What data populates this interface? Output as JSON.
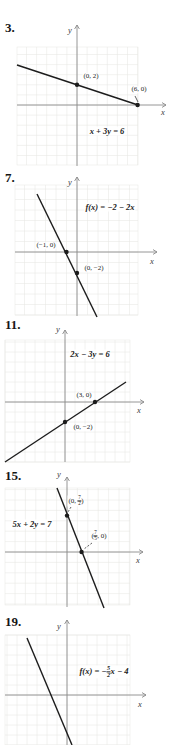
{
  "colors": {
    "line": "#1c1c1c",
    "axis": "#8a8a8a",
    "grid": "#e8e8e4",
    "text": "#1c1c1c",
    "background": "#ffffff"
  },
  "axis_labels": {
    "x": "x",
    "y": "y"
  },
  "chart_data": [
    {
      "type": "line",
      "id": "3",
      "problem_number": "3.",
      "equation": "x + 3y = 6",
      "equation_parts": [
        {
          "t": "x + 3y = 6"
        }
      ],
      "slope": -0.333,
      "y_intercept": 2,
      "x_intercept": 6,
      "xlim": [
        -6,
        6
      ],
      "ylim": [
        -6,
        6
      ],
      "grid_step": 1,
      "grid": true,
      "points": [
        {
          "x": 0,
          "y": 2,
          "label": "(0, 2)",
          "label_parts": [
            {
              "t": "(0, 2)"
            }
          ],
          "label_center": [
            91,
            77
          ]
        },
        {
          "x": 6,
          "y": 0,
          "label": "(6, 0)",
          "label_parts": [
            {
              "t": "(6, 0)"
            }
          ],
          "label_center": [
            139,
            90
          ],
          "leader": {
            "from": [
              135,
              96
            ],
            "to": [
              138,
              102
            ],
            "dash": false
          }
        }
      ],
      "layout": {
        "num_pos": [
          5,
          21
        ],
        "origin": [
          77,
          105
        ],
        "unit": 10.1,
        "grid_rect": {
          "left": 17,
          "top": 47,
          "right": 138,
          "bottom": 165
        },
        "y_axis": {
          "tip": 25,
          "bottom": 166
        },
        "x_axis": {
          "left": 17,
          "tip": 166
        },
        "x_label_center": [
          163,
          112
        ],
        "y_label_center": [
          70,
          30
        ],
        "line_px": [
          [
            17,
            65
          ],
          [
            138,
            105
          ]
        ],
        "eq_center": [
          107,
          131
        ]
      }
    },
    {
      "type": "line",
      "id": "7",
      "problem_number": "7.",
      "equation": "f(x) = −2 − 2x",
      "equation_parts": [
        {
          "t": "f(x) = −2 − 2x"
        }
      ],
      "slope": -2,
      "y_intercept": -2,
      "x_intercept": -1,
      "xlim": [
        -6,
        6
      ],
      "ylim": [
        -6,
        6
      ],
      "grid_step": 1,
      "grid": true,
      "points": [
        {
          "x": -1,
          "y": 0,
          "label": "(−1, 0)",
          "label_parts": [
            {
              "t": "(−1, 0)"
            }
          ],
          "label_center": [
            46,
            246
          ]
        },
        {
          "x": 0,
          "y": -2,
          "label": "(0, −2)",
          "label_parts": [
            {
              "t": "(0, −2)"
            }
          ],
          "label_center": [
            94,
            269
          ]
        }
      ],
      "layout": {
        "num_pos": [
          5,
          171
        ],
        "origin": [
          77,
          252
        ],
        "unit": 10.5,
        "grid_rect": {
          "left": 15,
          "top": 185,
          "right": 138,
          "bottom": 315
        },
        "y_axis": {
          "tip": 177,
          "bottom": 316
        },
        "x_axis": {
          "left": 15,
          "tip": 157
        },
        "x_label_center": [
          152,
          261
        ],
        "y_label_center": [
          70,
          182
        ],
        "line_px": [
          [
            37,
            194
          ],
          [
            97,
            317
          ]
        ],
        "eq_center": [
          110,
          207
        ]
      }
    },
    {
      "type": "line",
      "id": "11",
      "problem_number": "11.",
      "equation": "2x − 3y = 6",
      "equation_parts": [
        {
          "t": "2x − 3y = 6"
        }
      ],
      "slope": 0.667,
      "y_intercept": -2,
      "x_intercept": 3,
      "xlim": [
        -6,
        6.5
      ],
      "ylim": [
        -6,
        6
      ],
      "grid_step": 1,
      "grid": true,
      "points": [
        {
          "x": 3,
          "y": 0,
          "label": "(3, 0)",
          "label_parts": [
            {
              "t": "(3, 0)"
            }
          ],
          "label_center": [
            84,
            396
          ]
        },
        {
          "x": 0,
          "y": -2,
          "label": "(0, −2)",
          "label_parts": [
            {
              "t": "(0, −2)"
            }
          ],
          "label_center": [
            83,
            428
          ]
        }
      ],
      "layout": {
        "num_pos": [
          5,
          318
        ],
        "origin": [
          65,
          402
        ],
        "unit": 10,
        "grid_rect": {
          "left": 5,
          "top": 340,
          "right": 130,
          "bottom": 462
        },
        "y_axis": {
          "tip": 330,
          "bottom": 462
        },
        "x_axis": {
          "left": 5,
          "tip": 144
        },
        "x_label_center": [
          139,
          410
        ],
        "y_label_center": [
          58,
          329
        ],
        "line_px": [
          [
            5,
            462
          ],
          [
            126,
            382
          ]
        ],
        "eq_center": [
          90,
          354
        ]
      }
    },
    {
      "type": "line",
      "id": "15",
      "problem_number": "15.",
      "equation": "5x + 2y = 7",
      "equation_parts": [
        {
          "t": "5x + 2y = 7"
        }
      ],
      "slope": -2.5,
      "y_intercept": 3.5,
      "x_intercept": 1.4,
      "xlim": [
        -6,
        6
      ],
      "ylim": [
        -6,
        6
      ],
      "grid_step": 1,
      "grid": true,
      "points": [
        {
          "x": 0,
          "y": 3.5,
          "label": "(0, 7/2)",
          "label_parts": [
            {
              "t": "(0, "
            },
            {
              "f": [
                "7",
                "2"
              ]
            },
            {
              "t": ")"
            }
          ],
          "label_center": [
            76,
            501
          ],
          "leader": {
            "from": [
              71,
              507
            ],
            "to": [
              68,
              512
            ],
            "dash": true
          }
        },
        {
          "x": 1.4,
          "y": 0,
          "label": "(7/5, 0)",
          "label_parts": [
            {
              "t": "("
            },
            {
              "f": [
                "7",
                "5"
              ]
            },
            {
              "t": ", 0)"
            }
          ],
          "label_center": [
            99,
            536
          ],
          "leader": {
            "from": [
              92,
              543
            ],
            "to": [
              84,
              549
            ],
            "dash": true
          }
        }
      ],
      "layout": {
        "num_pos": [
          5,
          469
        ],
        "origin": [
          67,
          552
        ],
        "unit": 10.4,
        "grid_rect": {
          "left": 5,
          "top": 488,
          "right": 130,
          "bottom": 605
        },
        "y_axis": {
          "tip": 477,
          "bottom": 607
        },
        "x_axis": {
          "left": 5,
          "tip": 143
        },
        "x_label_center": [
          138,
          560
        ],
        "y_label_center": [
          59,
          474
        ],
        "line_px": [
          [
            57,
            488
          ],
          [
            104,
            608
          ]
        ],
        "eq_center": [
          32,
          524
        ]
      }
    },
    {
      "type": "line",
      "id": "19",
      "problem_number": "19.",
      "equation": "f(x) = −5/2x − 4",
      "equation_parts": [
        {
          "t": "f(x) = −"
        },
        {
          "f": [
            "5",
            "2"
          ]
        },
        {
          "t": "x − 4"
        }
      ],
      "slope": -2.5,
      "y_intercept": -4,
      "x_intercept": -1.6,
      "xlim": [
        -6,
        6.5
      ],
      "ylim": [
        -5,
        7
      ],
      "grid_step": 1,
      "grid": true,
      "points": [],
      "layout": {
        "num_pos": [
          5,
          615
        ],
        "origin": [
          67,
          695
        ],
        "unit": 10,
        "grid_rect": {
          "left": 5,
          "top": 635,
          "right": 130,
          "bottom": 745
        },
        "y_axis": {
          "tip": 620,
          "bottom": 745
        },
        "x_axis": {
          "left": 5,
          "tip": 146
        },
        "x_label_center": [
          140,
          704
        ],
        "y_label_center": [
          59,
          626
        ],
        "line_px": [
          [
            27,
            638
          ],
          [
            72,
            745
          ]
        ],
        "eq_center": [
          104,
          672
        ]
      }
    }
  ]
}
